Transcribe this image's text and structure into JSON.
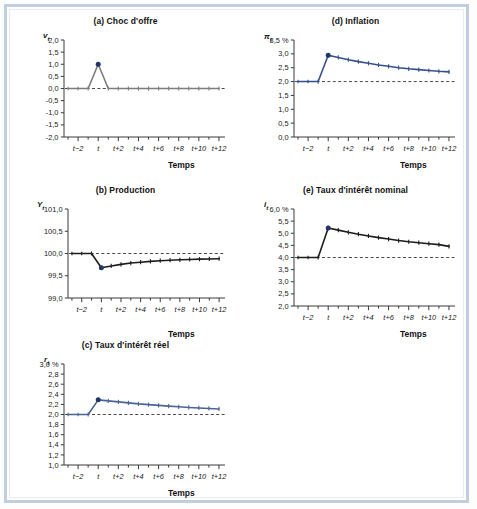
{
  "figure": {
    "background_color": "#ffffff",
    "frame_color": "#c2cedd"
  },
  "panels": [
    {
      "id": "a",
      "title": "(a) Choc d'offre",
      "ylabel": "v",
      "ylabel_sub": "t",
      "xlabel": "Temps",
      "yticks": [
        "2,0",
        "1,5",
        "1,0",
        "0,5",
        "0,0",
        "-0,5",
        "-1,0",
        "-1,5",
        "-2,0"
      ],
      "xticks": [
        "t−2",
        "t",
        "t+2",
        "t+4",
        "t+6",
        "t+8",
        "t+10",
        "t+12"
      ],
      "series_color": "#7d7d7d",
      "marker_color": "#23366b",
      "reference_value": "0,0"
    },
    {
      "id": "b",
      "title": "(b) Production",
      "ylabel": "Y",
      "ylabel_sub": "t",
      "xlabel": "Temps",
      "yticks": [
        "101,0",
        "100,5",
        "100,0",
        "99,5",
        "99,0"
      ],
      "xticks": [
        "t−2",
        "t",
        "t+2",
        "t+4",
        "t+6",
        "t+8",
        "t+10",
        "t+12"
      ],
      "series_color": "#1c1c1c",
      "marker_color": "#23366b",
      "reference_value": "100,0"
    },
    {
      "id": "c",
      "title": "(c) Taux d'intérêt réel",
      "ylabel": "r",
      "ylabel_sub": "t",
      "xlabel": "Temps",
      "unit": "%",
      "yticks": [
        "3,0 %",
        "2,8",
        "2,6",
        "2,4",
        "2,2",
        "2,0",
        "1,8",
        "1,6",
        "1,4",
        "1,2",
        "1,0"
      ],
      "xticks": [
        "t−2",
        "t",
        "t+2",
        "t+4",
        "t+6",
        "t+8",
        "t+10",
        "t+12"
      ],
      "series_color": "#4a6596",
      "marker_color": "#23366b",
      "reference_value": "2,0"
    },
    {
      "id": "d",
      "title": "(d) Inflation",
      "ylabel": "π",
      "ylabel_sub": "t",
      "xlabel": "Temps",
      "unit": "%",
      "yticks": [
        "3,5 %",
        "3,0",
        "2,5",
        "2,0",
        "1,5",
        "1,0",
        "0,5",
        "0,0"
      ],
      "xticks": [
        "t−2",
        "t",
        "t+2",
        "t+4",
        "t+6",
        "t+8",
        "t+10",
        "t+12"
      ],
      "series_color": "#34508c",
      "marker_color": "#23366b",
      "reference_value": "2,0"
    },
    {
      "id": "e",
      "title": "(e) Taux d'intérêt nominal",
      "ylabel": "i",
      "ylabel_sub": "t",
      "xlabel": "Temps",
      "unit": "%",
      "yticks": [
        "6,0 %",
        "5,5",
        "5,0",
        "4,5",
        "4,0",
        "3,5",
        "3,0",
        "2,5",
        "2,0"
      ],
      "xticks": [
        "t−2",
        "t",
        "t+2",
        "t+4",
        "t+6",
        "t+8",
        "t+10",
        "t+12"
      ],
      "series_color": "#1c1c1c",
      "marker_color": "#23366b",
      "reference_value": "4,0"
    }
  ],
  "chart_data": [
    {
      "type": "line",
      "id": "a",
      "title": "(a) Choc d'offre",
      "xlabel": "Temps",
      "ylabel": "v_t",
      "x": [
        -3,
        -2,
        -1,
        0,
        1,
        2,
        3,
        4,
        5,
        6,
        7,
        8,
        9,
        10,
        11,
        12
      ],
      "values": [
        0,
        0,
        0,
        1.0,
        0,
        0,
        0,
        0,
        0,
        0,
        0,
        0,
        0,
        0,
        0,
        0
      ],
      "ylim": [
        -2.0,
        2.0
      ],
      "ytick_values": [
        2.0,
        1.5,
        1.0,
        0.5,
        0.0,
        -0.5,
        -1.0,
        -1.5,
        -2.0
      ],
      "xtick_values": [
        -2,
        0,
        2,
        4,
        6,
        8,
        10,
        12
      ],
      "xtick_labels": [
        "t−2",
        "t",
        "t+2",
        "t+4",
        "t+6",
        "t+8",
        "t+10",
        "t+12"
      ],
      "reference_line": 0.0,
      "grid": false,
      "legend": "none",
      "highlight_point": {
        "x": 0,
        "y": 1.0
      }
    },
    {
      "type": "line",
      "id": "b",
      "title": "(b) Production",
      "xlabel": "Temps",
      "ylabel": "Y_t",
      "x": [
        -3,
        -2,
        -1,
        0,
        1,
        2,
        3,
        4,
        5,
        6,
        7,
        8,
        9,
        10,
        11,
        12
      ],
      "values": [
        100.0,
        100.0,
        100.0,
        99.68,
        99.72,
        99.755,
        99.785,
        99.805,
        99.823,
        99.838,
        99.85,
        99.858,
        99.866,
        99.873,
        99.878,
        99.883
      ],
      "ylim": [
        99.0,
        101.0
      ],
      "ytick_values": [
        101.0,
        100.5,
        100.0,
        99.5,
        99.0
      ],
      "xtick_values": [
        -2,
        0,
        2,
        4,
        6,
        8,
        10,
        12
      ],
      "xtick_labels": [
        "t−2",
        "t",
        "t+2",
        "t+4",
        "t+6",
        "t+8",
        "t+10",
        "t+12"
      ],
      "reference_line": 100.0,
      "grid": false,
      "legend": "none",
      "highlight_point": {
        "x": 0,
        "y": 99.68
      }
    },
    {
      "type": "line",
      "id": "c",
      "title": "(c) Taux d'intérêt réel",
      "xlabel": "Temps",
      "ylabel": "r_t",
      "x": [
        -3,
        -2,
        -1,
        0,
        1,
        2,
        3,
        4,
        5,
        6,
        7,
        8,
        9,
        10,
        11,
        12
      ],
      "values": [
        2.0,
        2.0,
        2.0,
        2.29,
        2.27,
        2.25,
        2.23,
        2.21,
        2.195,
        2.18,
        2.165,
        2.152,
        2.14,
        2.13,
        2.12,
        2.11
      ],
      "ylim": [
        1.0,
        3.0
      ],
      "ytick_values": [
        3.0,
        2.8,
        2.6,
        2.4,
        2.2,
        2.0,
        1.8,
        1.6,
        1.4,
        1.2,
        1.0
      ],
      "xtick_values": [
        -2,
        0,
        2,
        4,
        6,
        8,
        10,
        12
      ],
      "xtick_labels": [
        "t−2",
        "t",
        "t+2",
        "t+4",
        "t+6",
        "t+8",
        "t+10",
        "t+12"
      ],
      "reference_line": 2.0,
      "grid": false,
      "legend": "none",
      "highlight_point": {
        "x": 0,
        "y": 2.29
      }
    },
    {
      "type": "line",
      "id": "d",
      "title": "(d) Inflation",
      "xlabel": "Temps",
      "ylabel": "pi_t",
      "x": [
        -3,
        -2,
        -1,
        0,
        1,
        2,
        3,
        4,
        5,
        6,
        7,
        8,
        9,
        10,
        11,
        12
      ],
      "values": [
        2.0,
        2.0,
        2.0,
        2.95,
        2.87,
        2.79,
        2.72,
        2.66,
        2.6,
        2.55,
        2.5,
        2.46,
        2.43,
        2.4,
        2.37,
        2.35
      ],
      "ylim": [
        0.0,
        3.5
      ],
      "ytick_values": [
        3.5,
        3.0,
        2.5,
        2.0,
        1.5,
        1.0,
        0.5,
        0.0
      ],
      "xtick_values": [
        -2,
        0,
        2,
        4,
        6,
        8,
        10,
        12
      ],
      "xtick_labels": [
        "t−2",
        "t",
        "t+2",
        "t+4",
        "t+6",
        "t+8",
        "t+10",
        "t+12"
      ],
      "reference_line": 2.0,
      "grid": false,
      "legend": "none",
      "highlight_point": {
        "x": 0,
        "y": 2.95
      }
    },
    {
      "type": "line",
      "id": "e",
      "title": "(e) Taux d'intérêt nominal",
      "xlabel": "Temps",
      "ylabel": "i_t",
      "x": [
        -3,
        -2,
        -1,
        0,
        1,
        2,
        3,
        4,
        5,
        6,
        7,
        8,
        9,
        10,
        11,
        12
      ],
      "values": [
        4.0,
        4.0,
        4.0,
        5.22,
        5.13,
        5.04,
        4.96,
        4.89,
        4.82,
        4.76,
        4.7,
        4.65,
        4.61,
        4.57,
        4.53,
        4.46
      ],
      "ylim": [
        2.0,
        6.0
      ],
      "ytick_values": [
        6.0,
        5.5,
        5.0,
        4.5,
        4.0,
        3.5,
        3.0,
        2.5,
        2.0
      ],
      "xtick_values": [
        -2,
        0,
        2,
        4,
        6,
        8,
        10,
        12
      ],
      "xtick_labels": [
        "t−2",
        "t",
        "t+2",
        "t+4",
        "t+6",
        "t+8",
        "t+10",
        "t+12"
      ],
      "reference_line": 4.0,
      "grid": false,
      "legend": "none",
      "highlight_point": {
        "x": 0,
        "y": 5.22
      }
    }
  ]
}
